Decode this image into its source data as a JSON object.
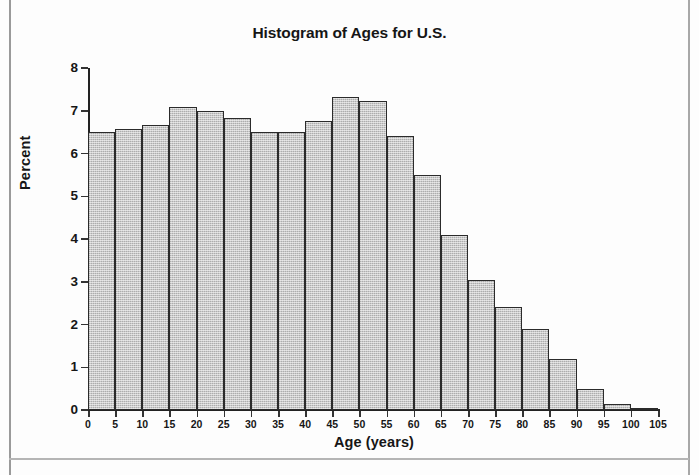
{
  "chart_data": {
    "type": "bar",
    "title": "Histogram of Ages for U.S.",
    "xlabel": "Age (years)",
    "ylabel": "Percent",
    "grid": false,
    "legend": null,
    "xlim": [
      0,
      105
    ],
    "ylim": [
      0,
      8
    ],
    "bin_width": 5,
    "x_tick_labels": [
      "0",
      "5",
      "10",
      "15",
      "20",
      "25",
      "30",
      "35",
      "40",
      "45",
      "50",
      "55",
      "60",
      "65",
      "70",
      "75",
      "80",
      "85",
      "90",
      "95",
      "100",
      "105"
    ],
    "y_tick_labels": [
      "0",
      "1",
      "2",
      "3",
      "4",
      "5",
      "6",
      "7",
      "8"
    ],
    "categories": [
      "0-5",
      "5-10",
      "10-15",
      "15-20",
      "20-25",
      "25-30",
      "30-35",
      "35-40",
      "40-45",
      "45-50",
      "50-55",
      "55-60",
      "60-65",
      "65-70",
      "70-75",
      "75-80",
      "80-85",
      "85-90",
      "90-95",
      "95-100",
      "100-105"
    ],
    "bin_starts": [
      0,
      5,
      10,
      15,
      20,
      25,
      30,
      35,
      40,
      45,
      50,
      55,
      60,
      65,
      70,
      75,
      80,
      85,
      90,
      95,
      100
    ],
    "values": [
      6.5,
      6.57,
      6.67,
      7.08,
      7.0,
      6.82,
      6.5,
      6.5,
      6.75,
      7.32,
      7.23,
      6.42,
      5.5,
      4.1,
      3.05,
      2.4,
      1.9,
      1.2,
      0.5,
      0.15,
      0.03
    ]
  },
  "style": {
    "bar_fill": "#c9c9c9",
    "bar_stroke": "#2b2b2b",
    "axis_color": "#222222",
    "text_color": "#161616",
    "page_background": "#fdfdfd"
  }
}
